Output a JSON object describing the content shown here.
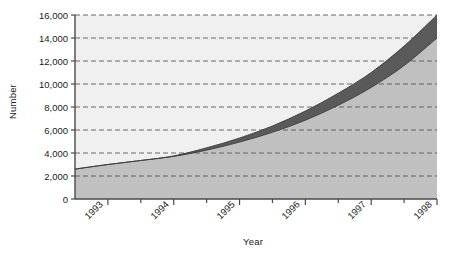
{
  "chart_data": {
    "type": "area",
    "title": "",
    "subtitle": "",
    "xlabel": "Year",
    "ylabel": "Number",
    "grid": true,
    "grid_style": "dashed-horizontal",
    "legend": "none",
    "xlim": [
      1992.5,
      1998
    ],
    "ylim": [
      0,
      16000
    ],
    "ytick_values": [
      0,
      2000,
      4000,
      6000,
      8000,
      10000,
      12000,
      14000,
      16000
    ],
    "ytick_labels": [
      "0",
      "2,000",
      "4,000",
      "6,000",
      "8,000",
      "10,000",
      "12,000",
      "14,000",
      "16,000"
    ],
    "xtick_values": [
      1993,
      1994,
      1995,
      1996,
      1997,
      1998
    ],
    "xtick_labels": [
      "1993",
      "1994",
      "1995",
      "1996",
      "1997",
      "1998"
    ],
    "xminor_tick_values": [
      1993.5,
      1994.5,
      1995.5,
      1996.5,
      1997.5
    ],
    "xtick_label_rotation": -45,
    "x": [
      1992.5,
      1993,
      1993.5,
      1994,
      1994.5,
      1995,
      1995.5,
      1996,
      1996.5,
      1997,
      1997.5,
      1998
    ],
    "series": [
      {
        "name": "upper",
        "fill_color": "#5a5a5a",
        "values": [
          2600,
          3000,
          3350,
          3750,
          4450,
          5300,
          6350,
          7650,
          9200,
          11000,
          13300,
          16000
        ]
      },
      {
        "name": "lower",
        "fill_color": "#c0c0c0",
        "values": [
          2600,
          3000,
          3350,
          3700,
          4250,
          4950,
          5800,
          6850,
          8150,
          9700,
          11600,
          14000
        ]
      }
    ],
    "colors": {
      "plot_background": "#f0f0f0",
      "lower_band": "#c0c0c0",
      "upper_band": "#5a5a5a",
      "axis": "#4a4a4a",
      "gridline": "#5a5a5a",
      "text": "#1a1a1a"
    },
    "plot_box": {
      "left": 75,
      "right": 437,
      "top": 15,
      "bottom": 199
    }
  }
}
